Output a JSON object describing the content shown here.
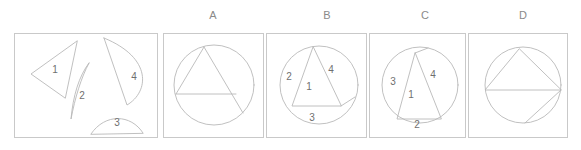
{
  "figure": {
    "kind": "geometry-dissection-puzzle",
    "stroke_color": "#b9b9b9",
    "border_color": "#c9c9c9",
    "text_color": "#6f6f6f"
  },
  "pieces_panel": {
    "name": "pieces",
    "pieces": [
      {
        "id": "1",
        "label": "1",
        "shape": "triangle"
      },
      {
        "id": "2",
        "label": "2",
        "shape": "thin-crescent"
      },
      {
        "id": "3",
        "label": "3",
        "shape": "small-circular-segment"
      },
      {
        "id": "4",
        "label": "4",
        "shape": "large-circular-segment"
      }
    ]
  },
  "options": [
    {
      "letter": "A",
      "description": "circle with inscribed triangle and horizontal chord, no numbered regions",
      "labels": []
    },
    {
      "letter": "B",
      "description": "circle with inscribed triangle, four numbered regions",
      "labels": [
        {
          "text": "2",
          "region": "left-segment"
        },
        {
          "text": "1",
          "region": "triangle"
        },
        {
          "text": "4",
          "region": "right-segment"
        },
        {
          "text": "3",
          "region": "bottom-segment"
        }
      ]
    },
    {
      "letter": "C",
      "description": "circle with narrow inscribed triangle, four numbered regions",
      "labels": [
        {
          "text": "3",
          "region": "left-segment"
        },
        {
          "text": "1",
          "region": "triangle"
        },
        {
          "text": "4",
          "region": "right-segment"
        },
        {
          "text": "2",
          "region": "bottom-segment"
        }
      ]
    },
    {
      "letter": "D",
      "description": "circle with inscribed triangle on a horizontal diameter plus extra chord, no numbered regions",
      "labels": []
    }
  ]
}
